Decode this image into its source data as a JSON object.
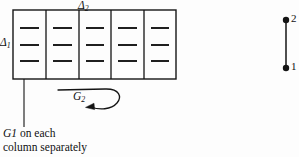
{
  "figure": {
    "background_color": "#fdfdfd",
    "ink_color": "#141414",
    "top_label": "Δ",
    "top_label_sub": "2",
    "left_label": "Δ",
    "left_label_sub": "1",
    "rotation_label": "G",
    "rotation_label_sub": "2",
    "caption_line1_italic": "G",
    "caption_line1_sub": "1",
    "caption_line1_rest": " on each",
    "caption_line2": "column separately",
    "node_top_label": "2",
    "node_bottom_label": "1"
  },
  "grid": {
    "columns": 5,
    "rows_of_dashes": 3,
    "x_left": 13,
    "x_right": 176,
    "y_top": 10,
    "y_bottom": 79,
    "dash_y": [
      28,
      45,
      61
    ],
    "divider_x": [
      46,
      79,
      111,
      144
    ]
  },
  "edge_graph": {
    "x": 286,
    "y_top": 20,
    "y_bottom": 68,
    "dot_radius": 3.2
  }
}
